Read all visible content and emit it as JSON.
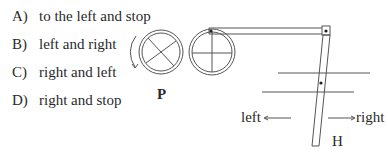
{
  "options": [
    {
      "letter": "A)",
      "text": "to the left and stop"
    },
    {
      "letter": "B)",
      "text": "left and right"
    },
    {
      "letter": "C)",
      "text": "right and left"
    },
    {
      "letter": "D)",
      "text": "right and stop"
    }
  ],
  "diagram": {
    "wheel_label": "P",
    "rod_label": "H",
    "left_label": "left",
    "right_label": "right",
    "stroke_color": "#555555"
  }
}
